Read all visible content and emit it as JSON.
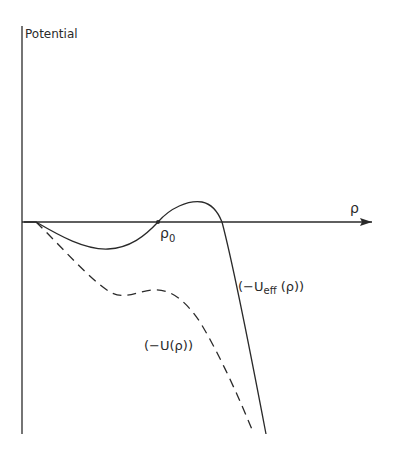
{
  "diagram": {
    "y_axis_label": "Potential",
    "x_axis_label": "ρ",
    "root_label": "ρ",
    "root_subscript": "0",
    "curves": [
      {
        "name": "effective-potential",
        "label": "(−U",
        "label_sub": "eff",
        "label_tail": " (ρ))",
        "style": "solid"
      },
      {
        "name": "potential",
        "label": "(−U(ρ))",
        "style": "dashed"
      }
    ],
    "colors": {
      "ink": "#2a2a2a",
      "background": "#ffffff"
    }
  }
}
